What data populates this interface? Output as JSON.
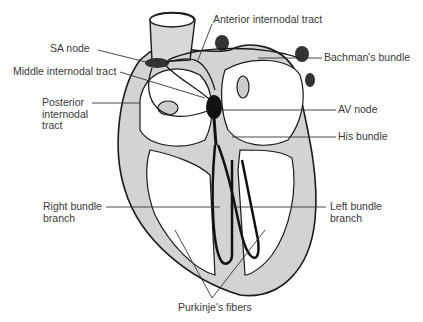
{
  "diagram": {
    "labels": {
      "anterior_internodal_tract": "Anterior internodal tract",
      "sa_node": "SA node",
      "bachmans_bundle": "Bachman's bundle",
      "middle_internodal_tract": "Middle internodal tract",
      "posterior_internodal_tract": "Posterior\ninternodal\ntract",
      "av_node": "AV node",
      "his_bundle": "His bundle",
      "right_bundle_branch": "Right bundle\nbranch",
      "left_bundle_branch": "Left bundle\nbranch",
      "purkinjes_fibers": "Purkinje's fibers"
    },
    "colors": {
      "outline": "#1a1a1a",
      "wall_fill": "#d3d3d3",
      "chamber_fill": "#ffffff",
      "shading": "#9a9a9a",
      "conduction": "#111111",
      "leader_line": "#333333",
      "text": "#3a3a3a"
    }
  }
}
